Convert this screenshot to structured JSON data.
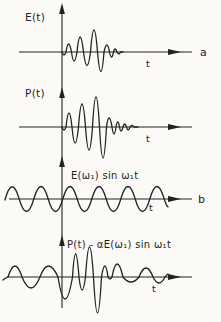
{
  "figure": {
    "type": "waveform-diagram",
    "background": "#fbfaf7",
    "line_color": "#222222",
    "labels": {
      "panel_a_signal": "E(t)",
      "panel_p_signal": "P(t)",
      "panel_b_signal": "E(ω₁) sin ω₁t",
      "panel_d_signal": "P(t) - αE(ω₁) sin ω₁t",
      "panel_a_letter": "a",
      "panel_b_letter": "b",
      "time_axis": "t"
    },
    "waveforms": [
      {
        "name": "E(t)",
        "panel": "a",
        "shape": "chirped wave packet beginning at t=0: oscillation grows to a maximum then decays with short ringing"
      },
      {
        "name": "P(t)",
        "panel": "",
        "shape": "wave packet similar to E(t) but with larger amplitude and a more pronounced ringing tail"
      },
      {
        "name": "E(ω₁) sin ω₁t",
        "panel": "b",
        "shape": "continuous constant-amplitude sine wave extending over all t, before and after t=0"
      },
      {
        "name": "P(t) - αE(ω₁) sin ω₁t",
        "panel": "",
        "shape": "small residual sine on both sides with a large oscillatory burst just after t=0"
      }
    ]
  }
}
